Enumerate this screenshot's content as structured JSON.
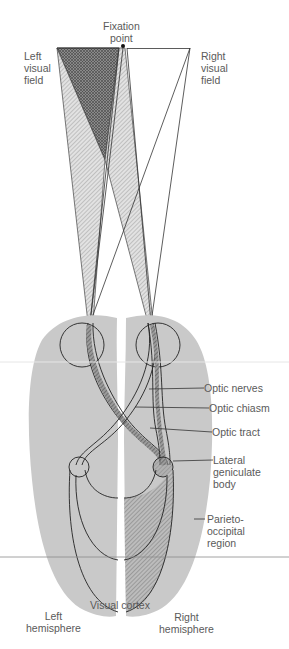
{
  "colors": {
    "brain_fill": "#c9c9c9",
    "line": "#333333",
    "label": "#5a5a5a",
    "hatch_dark": "#555555",
    "hatch_light": "#888888"
  },
  "labels": {
    "fixation_point": "Fixation\npoint",
    "left_visual_field": "Left\nvisual\nfield",
    "right_visual_field": "Right\nvisual\nfield",
    "optic_nerves": "Optic nerves",
    "optic_chiasm": "Optic chiasm",
    "optic_tract": "Optic tract",
    "lateral_geniculate_body": "Lateral\ngeniculate\nbody",
    "parieto_occipital_region": "Parieto-\noccipital\nregion",
    "visual_cortex": "Visual cortex",
    "left_hemisphere": "Left\nhemisphere",
    "right_hemisphere": "Right\nhemisphere"
  }
}
